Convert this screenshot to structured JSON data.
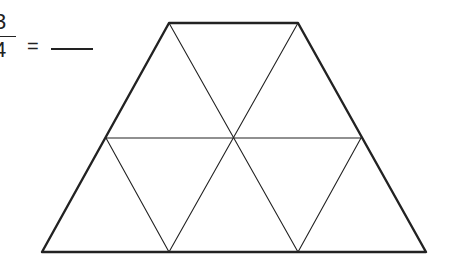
{
  "equation": {
    "numerator": "3",
    "denominator": "4",
    "equals": "=",
    "answer_blank": ""
  },
  "diagram": {
    "shape": "trapezoid",
    "stroke_color": "#222222",
    "outline_vertices": [
      [
        169,
        23
      ],
      [
        298,
        23
      ],
      [
        426,
        252
      ],
      [
        42,
        252
      ]
    ],
    "midline": [
      [
        106,
        138
      ],
      [
        361,
        138
      ]
    ],
    "inner_lines": [
      [
        [
          169,
          23
        ],
        [
          298,
          252
        ]
      ],
      [
        [
          298,
          23
        ],
        [
          169,
          252
        ]
      ],
      [
        [
          106,
          138
        ],
        [
          169,
          252
        ]
      ],
      [
        [
          361,
          138
        ],
        [
          298,
          252
        ]
      ]
    ],
    "triangle_count": 6
  }
}
